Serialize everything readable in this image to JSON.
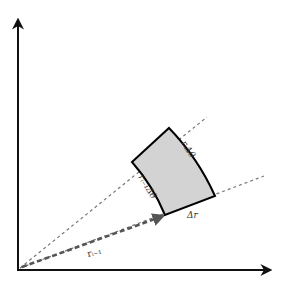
{
  "diagram": {
    "type": "polar-area-element",
    "colors": {
      "axis": "#111111",
      "ray": "#777777",
      "radius_vector": "#555555",
      "sector_fill": "#d3d3d3",
      "sector_stroke": "#000000",
      "label": "#333333"
    },
    "labels": {
      "outer_arc": "rᵢΔθ",
      "inner_arc": "rᵢ₋₁Δθ",
      "radial_side": "Δr",
      "radius_vector": "rᵢ₋₁"
    }
  }
}
